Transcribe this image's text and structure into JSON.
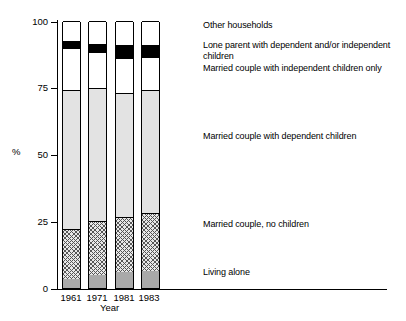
{
  "chart_data": {
    "type": "bar",
    "subtype": "stacked-percentage-column",
    "title": "",
    "xlabel": "Year",
    "ylabel": "%",
    "categories": [
      "1961",
      "1971",
      "1981",
      "1983"
    ],
    "ylim": [
      0,
      100
    ],
    "yticks": [
      0,
      25,
      50,
      75,
      100
    ],
    "ytick_labels": [
      "0",
      "25",
      "50",
      "75",
      "100"
    ],
    "grid": false,
    "legend_position": "right-aligned-to-last-bar",
    "stack_order_bottom_to_top": [
      "Living alone",
      "Married couple, no children",
      "Married couple with dependent children",
      "Married couple with independent children only",
      "Lone parent with dependent and/or independent children",
      "Other households"
    ],
    "series": [
      {
        "name": "Living alone",
        "fill": "grey",
        "values": [
          3.5,
          5.0,
          6.0,
          6.5
        ]
      },
      {
        "name": "Married couple, no children",
        "fill": "hatch",
        "values": [
          18.5,
          20.0,
          20.5,
          21.5
        ]
      },
      {
        "name": "Married couple with dependent children",
        "fill": "light",
        "values": [
          52.0,
          50.0,
          46.5,
          46.0
        ]
      },
      {
        "name": "Married couple with independent children only",
        "fill": "dots",
        "values": [
          16.0,
          13.5,
          13.0,
          12.5
        ]
      },
      {
        "name": "Lone parent with dependent and/or independent children",
        "fill": "black",
        "values": [
          2.5,
          3.0,
          5.0,
          4.5
        ]
      },
      {
        "name": "Other households",
        "fill": "white",
        "values": [
          7.5,
          8.5,
          9.0,
          9.0
        ]
      }
    ]
  },
  "axes": {
    "y_title": "%",
    "x_title": "Year",
    "y_tick_0": "0",
    "y_tick_25": "25",
    "y_tick_50": "50",
    "y_tick_75": "75",
    "y_tick_100": "100",
    "x_tick_1": "1961",
    "x_tick_2": "1971",
    "x_tick_3": "1981",
    "x_tick_4": "1983"
  },
  "legend": {
    "items": [
      {
        "label": "Other households",
        "swatch": "white"
      },
      {
        "label": "Lone parent with dependent and/or independent children",
        "swatch": "black"
      },
      {
        "label": "Married couple with independent children only",
        "swatch": "dots"
      },
      {
        "label": "Married couple with dependent children",
        "swatch": "light"
      },
      {
        "label": "Married couple, no children",
        "swatch": "hatch"
      },
      {
        "label": "Living alone",
        "swatch": "grey"
      }
    ]
  }
}
